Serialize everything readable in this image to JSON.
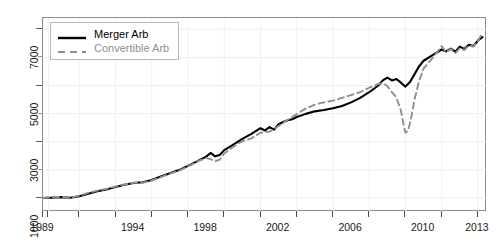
{
  "chart_data": {
    "type": "line",
    "title": "",
    "xlabel": "",
    "ylabel": "",
    "xlim": [
      1989,
      2013.5
    ],
    "ylim": [
      500,
      7400
    ],
    "grid": true,
    "legend_position": "top-left",
    "y_ticks_major": [
      1000,
      3000,
      5000,
      7000
    ],
    "y_tick_labels": [
      "1000",
      "3000",
      "5000",
      "7000"
    ],
    "y_ticks_minor": [
      2000,
      4000,
      6000
    ],
    "x_ticks": [
      1989,
      1989.3,
      1991,
      1993,
      1995,
      1997,
      1999,
      2001,
      2003,
      2005,
      2007,
      2009,
      2011,
      2013
    ],
    "x_tick_labels": [
      {
        "value": 1989,
        "label": "1989"
      },
      {
        "value": 1994,
        "label": "1994"
      },
      {
        "value": 1998,
        "label": "1998"
      },
      {
        "value": 2002,
        "label": "2002"
      },
      {
        "value": 2006,
        "label": "2006"
      },
      {
        "value": 2010,
        "label": "2010"
      },
      {
        "value": 2013,
        "label": "2013"
      }
    ],
    "series": [
      {
        "name": "Merger Arb",
        "style": "solid",
        "color": "#000000",
        "x": [
          1989.0,
          1989.5,
          1990.0,
          1990.5,
          1991.0,
          1991.5,
          1992.0,
          1992.5,
          1993.0,
          1993.5,
          1994.0,
          1994.5,
          1995.0,
          1995.5,
          1996.0,
          1996.5,
          1997.0,
          1997.5,
          1998.0,
          1998.25,
          1998.5,
          1998.75,
          1999.0,
          1999.5,
          2000.0,
          2000.5,
          2001.0,
          2001.25,
          2001.5,
          2001.75,
          2002.0,
          2002.25,
          2002.5,
          2002.75,
          2003.0,
          2003.5,
          2004.0,
          2004.5,
          2005.0,
          2005.5,
          2006.0,
          2006.5,
          2007.0,
          2007.5,
          2007.75,
          2008.0,
          2008.25,
          2008.5,
          2008.75,
          2009.0,
          2009.25,
          2009.5,
          2009.75,
          2010.0,
          2010.5,
          2011.0,
          2011.25,
          2011.5,
          2011.75,
          2012.0,
          2012.25,
          2012.5,
          2012.75,
          2013.0,
          2013.25
        ],
        "values": [
          1000,
          1010,
          1030,
          1005,
          1060,
          1150,
          1240,
          1300,
          1390,
          1470,
          1530,
          1560,
          1640,
          1760,
          1880,
          1990,
          2140,
          2300,
          2470,
          2600,
          2480,
          2530,
          2700,
          2900,
          3100,
          3280,
          3480,
          3400,
          3520,
          3430,
          3620,
          3700,
          3760,
          3800,
          3880,
          3990,
          4080,
          4130,
          4190,
          4270,
          4400,
          4560,
          4760,
          5000,
          5180,
          5280,
          5180,
          5230,
          5100,
          4960,
          5120,
          5400,
          5680,
          5880,
          6080,
          6280,
          6210,
          6310,
          6200,
          6380,
          6300,
          6450,
          6400,
          6600,
          6720
        ]
      },
      {
        "name": "Convertible Arb",
        "style": "dashed",
        "color": "#8f8f8f",
        "x": [
          1989.0,
          1989.5,
          1990.0,
          1990.5,
          1991.0,
          1991.5,
          1992.0,
          1992.5,
          1993.0,
          1993.5,
          1994.0,
          1994.5,
          1995.0,
          1995.5,
          1996.0,
          1996.5,
          1997.0,
          1997.5,
          1998.0,
          1998.25,
          1998.5,
          1998.75,
          1999.0,
          1999.5,
          2000.0,
          2000.5,
          2001.0,
          2001.5,
          2002.0,
          2002.5,
          2003.0,
          2003.5,
          2004.0,
          2004.5,
          2005.0,
          2005.5,
          2006.0,
          2006.5,
          2007.0,
          2007.5,
          2007.75,
          2008.0,
          2008.25,
          2008.5,
          2008.75,
          2008.9,
          2009.0,
          2009.15,
          2009.3,
          2009.5,
          2009.75,
          2010.0,
          2010.5,
          2011.0,
          2011.25,
          2011.5,
          2011.75,
          2012.0,
          2012.25,
          2012.5,
          2012.75,
          2013.0,
          2013.25
        ],
        "values": [
          1000,
          1020,
          1040,
          1010,
          1080,
          1180,
          1260,
          1320,
          1400,
          1480,
          1540,
          1540,
          1620,
          1740,
          1860,
          1970,
          2120,
          2290,
          2420,
          2380,
          2300,
          2360,
          2580,
          2820,
          3020,
          3120,
          3320,
          3360,
          3560,
          3780,
          3980,
          4180,
          4320,
          4400,
          4460,
          4560,
          4660,
          4760,
          4920,
          5060,
          5080,
          4980,
          4760,
          4580,
          4100,
          3600,
          3320,
          3400,
          3800,
          4500,
          5150,
          5600,
          5980,
          6400,
          6180,
          6300,
          6150,
          6330,
          6260,
          6420,
          6380,
          6600,
          6850
        ]
      }
    ]
  },
  "legend": {
    "items": [
      {
        "label": "Merger Arb",
        "style": "solid",
        "color": "#000000"
      },
      {
        "label": "Convertible Arb",
        "style": "dashed",
        "color": "#8f8f8f"
      }
    ]
  }
}
